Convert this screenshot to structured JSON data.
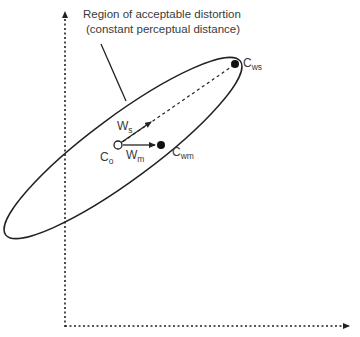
{
  "diagram": {
    "caption": {
      "line1": "Region of acceptable distortion",
      "line2": "(constant perceptual distance)"
    },
    "points": {
      "co": {
        "base": "C",
        "sub": "o",
        "style": "open-circle"
      },
      "cwm": {
        "base": "C",
        "sub": "wm",
        "style": "filled-circle"
      },
      "cws": {
        "base": "C",
        "sub": "ws",
        "style": "filled-circle"
      }
    },
    "vectors": {
      "ws": {
        "base": "W",
        "sub": "s"
      },
      "wm": {
        "base": "W",
        "sub": "m"
      }
    },
    "colors": {
      "stroke": "#222222",
      "text": "#3a3a3a",
      "background": "#ffffff"
    }
  }
}
